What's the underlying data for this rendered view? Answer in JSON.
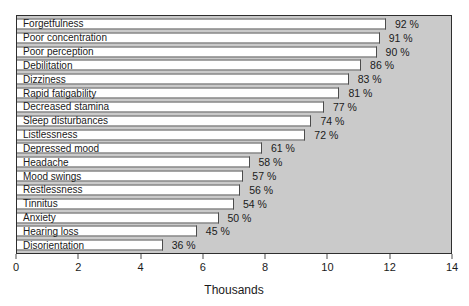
{
  "chart_data": {
    "type": "bar",
    "orientation": "horizontal",
    "title": "",
    "xlabel": "Thousands",
    "ylabel": "",
    "xlim": [
      0,
      14
    ],
    "x_ticks": [
      0,
      2,
      4,
      6,
      8,
      10,
      12,
      14
    ],
    "grid": false,
    "legend": "none",
    "rows": [
      {
        "label": "Forgetfulness",
        "percent": 92,
        "value_thousands": 11.9,
        "percent_label": "92 %"
      },
      {
        "label": "Poor concentration",
        "percent": 91,
        "value_thousands": 11.7,
        "percent_label": "91 %"
      },
      {
        "label": "Poor perception",
        "percent": 90,
        "value_thousands": 11.6,
        "percent_label": "90 %"
      },
      {
        "label": "Debilitation",
        "percent": 86,
        "value_thousands": 11.1,
        "percent_label": "86 %"
      },
      {
        "label": "Dizziness",
        "percent": 83,
        "value_thousands": 10.7,
        "percent_label": "83 %"
      },
      {
        "label": "Rapid fatigability",
        "percent": 81,
        "value_thousands": 10.4,
        "percent_label": "81 %"
      },
      {
        "label": "Decreased stamina",
        "percent": 77,
        "value_thousands": 9.9,
        "percent_label": "77 %"
      },
      {
        "label": "Sleep disturbances",
        "percent": 74,
        "value_thousands": 9.5,
        "percent_label": "74 %"
      },
      {
        "label": "Listlessness",
        "percent": 72,
        "value_thousands": 9.3,
        "percent_label": "72 %"
      },
      {
        "label": "Depressed mood",
        "percent": 61,
        "value_thousands": 7.9,
        "percent_label": "61 %"
      },
      {
        "label": "Headache",
        "percent": 58,
        "value_thousands": 7.5,
        "percent_label": "58 %"
      },
      {
        "label": "Mood swings",
        "percent": 57,
        "value_thousands": 7.3,
        "percent_label": "57 %"
      },
      {
        "label": "Restlessness",
        "percent": 56,
        "value_thousands": 7.2,
        "percent_label": "56 %"
      },
      {
        "label": "Tinnitus",
        "percent": 54,
        "value_thousands": 7.0,
        "percent_label": "54 %"
      },
      {
        "label": "Anxiety",
        "percent": 50,
        "value_thousands": 6.5,
        "percent_label": "50 %"
      },
      {
        "label": "Hearing loss",
        "percent": 45,
        "value_thousands": 5.8,
        "percent_label": "45 %"
      },
      {
        "label": "Disorientation",
        "percent": 36,
        "value_thousands": 4.7,
        "percent_label": "36 %"
      }
    ]
  },
  "colors": {
    "plot_background": "#cacaca",
    "bar_fill": "#ffffff",
    "bar_border": "#4c4c4c",
    "plot_border": "#2e2e2e",
    "text": "#1a1a1a",
    "page_background": "#ffffff"
  }
}
